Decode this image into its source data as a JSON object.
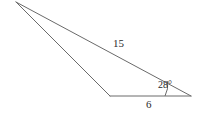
{
  "figure": {
    "type": "triangle-geometry-diagram",
    "background_color": "#ffffff",
    "stroke_color": "#6a6a6a",
    "text_color": "#2b2b2b",
    "stroke_width": 1,
    "vertices": {
      "apex": {
        "name": "apex-vertex",
        "x": 16,
        "y": 2
      },
      "base_left": {
        "name": "base-left-vertex",
        "x": 110,
        "y": 96
      },
      "base_right": {
        "name": "base-right-vertex",
        "x": 191,
        "y": 96
      }
    },
    "edges": [
      {
        "name": "long-side",
        "from": "apex",
        "to": "base_right",
        "label": "15"
      },
      {
        "name": "base-side",
        "from": "base_left",
        "to": "base_right",
        "label": "6"
      },
      {
        "name": "short-side",
        "from": "apex",
        "to": "base_left",
        "label": ""
      }
    ],
    "angle_arc": {
      "name": "angle-arc-at-base-right",
      "at_vertex": "base_right",
      "radius": 26,
      "label": "28°"
    }
  },
  "labels": {
    "side_long": "15",
    "angle": "28°",
    "side_base": "6"
  }
}
